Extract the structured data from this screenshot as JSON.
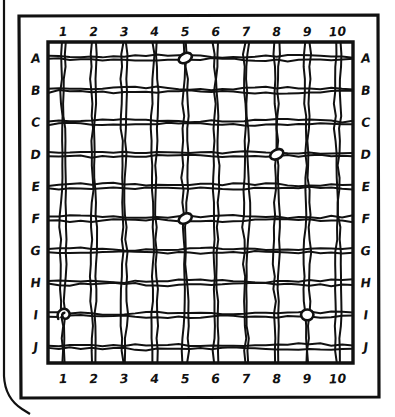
{
  "board": {
    "title": "Hand-drawn grid board",
    "style": "hand-drawn ink sketch, black on white",
    "ink_color": "#111111",
    "paper_color": "#ffffff",
    "columns": 10,
    "rows": 10,
    "column_labels_top": [
      "1",
      "2",
      "3",
      "4",
      "5",
      "6",
      "7",
      "8",
      "9",
      "10"
    ],
    "column_labels_bottom": [
      "1",
      "2",
      "3",
      "4",
      "5",
      "6",
      "7",
      "8",
      "9",
      "10"
    ],
    "row_labels_left": [
      "A",
      "B",
      "C",
      "D",
      "E",
      "F",
      "G",
      "H",
      "I",
      "J"
    ],
    "row_labels_right": [
      "A",
      "B",
      "C",
      "D",
      "E",
      "F",
      "G",
      "H",
      "I",
      "J"
    ],
    "frame": {
      "outer_rounded_edge": true,
      "inner_rectangle": true,
      "grid_rectangle": true
    }
  },
  "markers": [
    {
      "id": "marker-1",
      "label": "A5",
      "column": 5,
      "row": "A",
      "shape": "oval-peg"
    },
    {
      "id": "marker-2",
      "label": "D8",
      "column": 8,
      "row": "D",
      "shape": "oval-peg"
    },
    {
      "id": "marker-3",
      "label": "F5",
      "column": 5,
      "row": "F",
      "shape": "oval-peg"
    },
    {
      "id": "marker-4",
      "label": "I1",
      "column": 1,
      "row": "I",
      "shape": "curl-peg"
    },
    {
      "id": "marker-5",
      "label": "I9",
      "column": 9,
      "row": "I",
      "shape": "round-peg"
    }
  ],
  "chart_data": {
    "type": "heatmap",
    "xlabel": "",
    "ylabel": "",
    "x": [
      "1",
      "2",
      "3",
      "4",
      "5",
      "6",
      "7",
      "8",
      "9",
      "10"
    ],
    "y": [
      "A",
      "B",
      "C",
      "D",
      "E",
      "F",
      "G",
      "H",
      "I",
      "J"
    ],
    "grid": true,
    "legend": "none",
    "occupied_cells": [
      "A5",
      "D8",
      "F5",
      "I1",
      "I9"
    ],
    "values": [
      [
        0,
        0,
        0,
        0,
        1,
        0,
        0,
        0,
        0,
        0
      ],
      [
        0,
        0,
        0,
        0,
        0,
        0,
        0,
        0,
        0,
        0
      ],
      [
        0,
        0,
        0,
        0,
        0,
        0,
        0,
        0,
        0,
        0
      ],
      [
        0,
        0,
        0,
        0,
        0,
        0,
        0,
        1,
        0,
        0
      ],
      [
        0,
        0,
        0,
        0,
        0,
        0,
        0,
        0,
        0,
        0
      ],
      [
        0,
        0,
        0,
        0,
        1,
        0,
        0,
        0,
        0,
        0
      ],
      [
        0,
        0,
        0,
        0,
        0,
        0,
        0,
        0,
        0,
        0
      ],
      [
        0,
        0,
        0,
        0,
        0,
        0,
        0,
        0,
        0,
        0
      ],
      [
        1,
        0,
        0,
        0,
        0,
        0,
        0,
        0,
        1,
        0
      ],
      [
        0,
        0,
        0,
        0,
        0,
        0,
        0,
        0,
        0,
        0
      ]
    ]
  }
}
